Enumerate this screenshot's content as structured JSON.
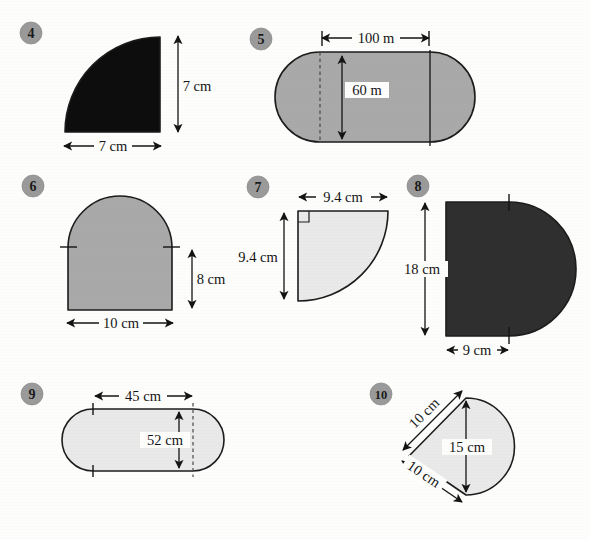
{
  "page": {
    "background_color": "#fdfdfc",
    "ink_color": "#141414",
    "badge_color": "#9a9a9a"
  },
  "problems": [
    {
      "number": "4",
      "shape": "quarter-circle",
      "fill_color": "#0d0d0d",
      "labels": [
        {
          "text": "7 cm",
          "orientation": "vertical-dimension"
        },
        {
          "text": "7 cm",
          "orientation": "horizontal-dimension"
        }
      ]
    },
    {
      "number": "5",
      "shape": "stadium-capsule",
      "fill_color": "#a9a9a9",
      "labels": [
        {
          "text": "100 m",
          "orientation": "horizontal-dimension"
        },
        {
          "text": "60 m",
          "orientation": "vertical-dimension"
        }
      ]
    },
    {
      "number": "6",
      "shape": "rectangle-with-semicircle-top",
      "fill_color": "#a9a9a9",
      "labels": [
        {
          "text": "8 cm",
          "orientation": "vertical-dimension"
        },
        {
          "text": "10 cm",
          "orientation": "horizontal-dimension"
        }
      ]
    },
    {
      "number": "7",
      "shape": "quarter-circle-right-angle",
      "fill_color": "#e9e9e9",
      "labels": [
        {
          "text": "9.4 cm",
          "orientation": "horizontal-dimension"
        },
        {
          "text": "9.4 cm",
          "orientation": "vertical-dimension"
        }
      ]
    },
    {
      "number": "8",
      "shape": "rectangle-with-semicircle-right",
      "fill_color": "#2f2f2f",
      "labels": [
        {
          "text": "18 cm",
          "orientation": "vertical-dimension"
        },
        {
          "text": "9 cm",
          "orientation": "horizontal-dimension"
        }
      ]
    },
    {
      "number": "9",
      "shape": "stadium-capsule",
      "fill_color": "#e9e9e9",
      "labels": [
        {
          "text": "45 cm",
          "orientation": "horizontal-dimension"
        },
        {
          "text": "52 cm",
          "orientation": "vertical-dimension"
        }
      ]
    },
    {
      "number": "10",
      "shape": "triangle-with-semicircle",
      "fill_color": "#e9e9e9",
      "labels": [
        {
          "text": "10 cm",
          "orientation": "diagonal-up"
        },
        {
          "text": "10 cm",
          "orientation": "diagonal-down"
        },
        {
          "text": "15 cm",
          "orientation": "vertical-dimension"
        }
      ]
    }
  ]
}
